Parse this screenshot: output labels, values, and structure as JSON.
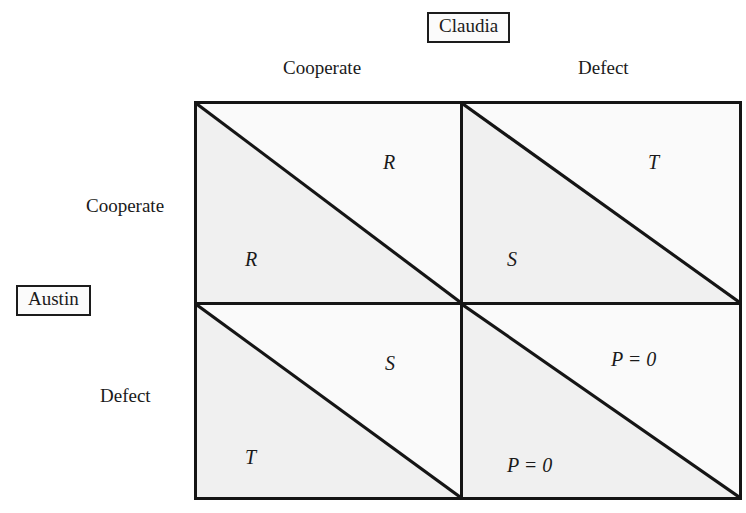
{
  "diagram": {
    "type": "payoff-matrix",
    "title_visible": false,
    "colors": {
      "ink": "#151515",
      "paper": "#ffffff",
      "triangle_shade": "#f0f0f0"
    },
    "players": {
      "column": {
        "name": "Claudia",
        "position": "top",
        "boxed": true
      },
      "row": {
        "name": "Austin",
        "position": "left",
        "boxed": true
      }
    },
    "strategies": {
      "column_headers": [
        "Cooperate",
        "Defect"
      ],
      "row_headers": [
        "Cooperate",
        "Defect"
      ]
    },
    "cells": [
      {
        "id": "cell-cc",
        "row_strategy": "Cooperate",
        "column_strategy": "Cooperate",
        "upper_right_payoff": "R",
        "lower_left_payoff": "R"
      },
      {
        "id": "cell-cd",
        "row_strategy": "Cooperate",
        "column_strategy": "Defect",
        "upper_right_payoff": "T",
        "lower_left_payoff": "S"
      },
      {
        "id": "cell-dc",
        "row_strategy": "Defect",
        "column_strategy": "Cooperate",
        "upper_right_payoff": "S",
        "lower_left_payoff": "T"
      },
      {
        "id": "cell-dd",
        "row_strategy": "Defect",
        "column_strategy": "Defect",
        "upper_right_payoff": "P = 0",
        "lower_left_payoff": "P = 0"
      }
    ]
  }
}
